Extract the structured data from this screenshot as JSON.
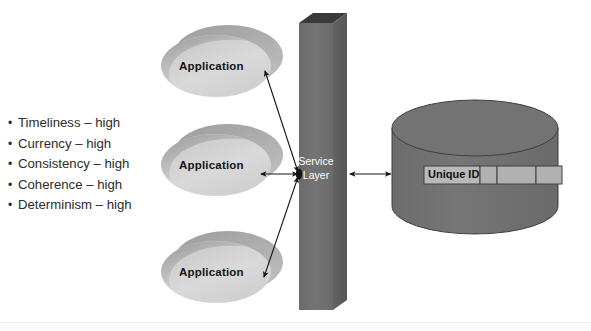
{
  "diagram": {
    "attributes": {
      "name": "data-quality-attributes",
      "items": [
        {
          "bullet": "•",
          "label": "Timeliness – high"
        },
        {
          "bullet": "•",
          "label": "Currency – high"
        },
        {
          "bullet": "•",
          "label": "Consistency – high"
        },
        {
          "bullet": "•",
          "label": "Coherence – high"
        },
        {
          "bullet": "•",
          "label": "Determinism – high"
        }
      ]
    },
    "applications": [
      {
        "label": "Application"
      },
      {
        "label": "Application"
      },
      {
        "label": "Application"
      }
    ],
    "service_layer": {
      "label_line1": "Service",
      "label_line2": "Layer"
    },
    "datastore": {
      "name": "database-cylinder",
      "row": {
        "key_cell": "Unique ID",
        "empty_cells": [
          "",
          "",
          ""
        ]
      }
    },
    "connectors": [
      {
        "name": "app1-service-link",
        "type": "double-arrow"
      },
      {
        "name": "app2-service-link",
        "type": "double-arrow"
      },
      {
        "name": "app3-service-link",
        "type": "double-arrow"
      },
      {
        "name": "service-datastore-link",
        "type": "double-arrow"
      }
    ],
    "colors": {
      "ellipse_light": "#d8d8d8",
      "ellipse_shadow": "#b6b6b6",
      "ellipse_top_shade": "#a9a9a9",
      "service_box_front": "#6e6e6e",
      "service_box_side": "#5e5e5e",
      "service_box_top": "#3a3a3a",
      "cylinder_body": "#707070",
      "cylinder_outline": "#3c3c3c",
      "row_cell": "#b5b5b5",
      "arrow": "#1a1a1a",
      "text_dark": "#2b2b2b",
      "text_white": "#ffffff",
      "background": "#ffffff"
    }
  }
}
